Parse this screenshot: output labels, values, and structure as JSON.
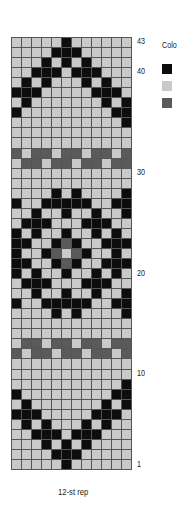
{
  "chart": {
    "title": "12-st rep",
    "columns": 12,
    "rows": 43,
    "row_labels": [
      {
        "label": "43",
        "row": 43
      },
      {
        "label": "40",
        "row": 40
      },
      {
        "label": "30",
        "row": 30
      },
      {
        "label": "20",
        "row": 20
      },
      {
        "label": "10",
        "row": 10
      },
      {
        "label": "1",
        "row": 1
      }
    ],
    "legend": {
      "title": "Colo",
      "swatches": [
        {
          "name": "black",
          "color": "#0d0d0d"
        },
        {
          "name": "light-gray",
          "color": "#c9c9c9"
        },
        {
          "name": "dark-gray",
          "color": "#5a5a5a"
        }
      ]
    },
    "grid_top_to_bottom": [
      ".....B......",
      "....BBB.....",
      "...B.B.B....",
      "..BBB.BBB...",
      ".B.B...B.B..",
      "BBB.....BBB.",
      ".B.......B.B",
      "B.........BB",
      "...........B",
      "............",
      "............",
      "G.GG.GG.GG.G",
      ".GG.GG.GG.GG",
      "............",
      "............",
      "....B.B....B",
      "B..BBBBB..BB",
      "..B..B..B..B",
      ".BBB...BBB..",
      "B.B..B..B.B.",
      "BB..BGB..BBB",
      "B..BG.GB..B.",
      "BB..BGB..BBB",
      "B.B..B..B.B.",
      ".BBB...BBB..",
      "..B..B..B..B",
      "B..BBBBB..BB",
      "....B.B....B",
      "............",
      "............",
      ".GG.GG.GG.GG",
      "G.GG.GG.GG.G",
      "............",
      "............",
      "...........B",
      "B.........BB",
      ".B.......B.B",
      "BBB.....BBB.",
      ".B.B...B.B..",
      "..BBB.BBB...",
      "...B.B.B....",
      "....BBB.....",
      ".....B......"
    ]
  }
}
